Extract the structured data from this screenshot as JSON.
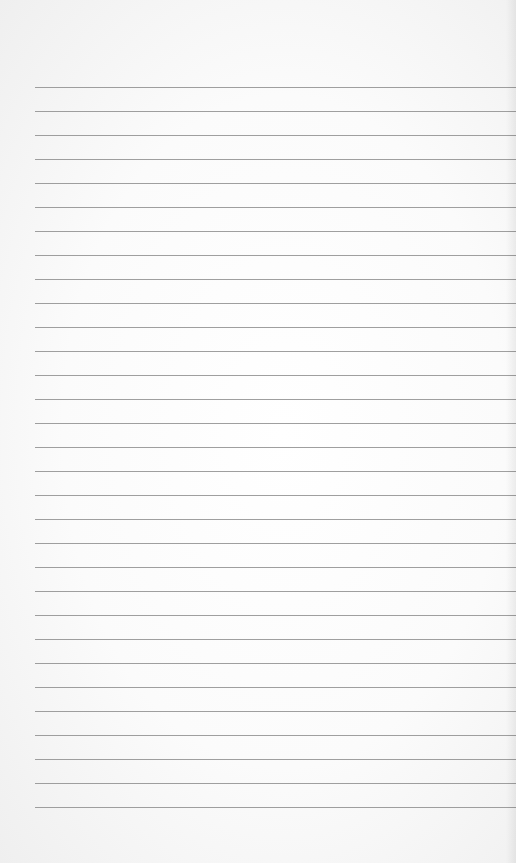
{
  "page": {
    "type": "lined-paper",
    "background_color": "#fbfbfb",
    "line_color": "#8e8e8e",
    "line_count": 31,
    "first_line_y": 87,
    "line_spacing": 24,
    "line_left": 35
  }
}
